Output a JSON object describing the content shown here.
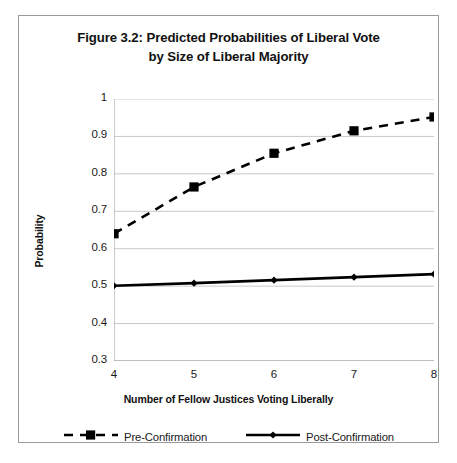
{
  "figure": {
    "title_line_1": "Figure 3.2: Predicted Probabilities of Liberal Vote",
    "title_line_2": "by Size of Liberal Majority"
  },
  "chart_data": {
    "type": "line",
    "title": "Figure 3.2: Predicted Probabilities of Liberal Vote by Size of Liberal Majority",
    "xlabel": "Number of Fellow Justices Voting Liberally",
    "ylabel": "Probability",
    "x": [
      4,
      5,
      6,
      7,
      8
    ],
    "xlim": [
      4,
      8
    ],
    "ylim": [
      0.3,
      1
    ],
    "xticks": [
      "4",
      "5",
      "6",
      "7",
      "8"
    ],
    "yticks": [
      "0.3",
      "0.4",
      "0.5",
      "0.6",
      "0.7",
      "0.8",
      "0.9",
      "1"
    ],
    "grid": "horizontal",
    "legend_position": "bottom",
    "series": [
      {
        "name": "Pre-Confirmation",
        "values": [
          0.64,
          0.765,
          0.855,
          0.915,
          0.952
        ],
        "line_style": "dashed",
        "marker": "square",
        "color": "#000000"
      },
      {
        "name": "Post-Confirmation",
        "values": [
          0.501,
          0.508,
          0.516,
          0.524,
          0.532
        ],
        "line_style": "solid",
        "marker": "diamond",
        "color": "#000000"
      }
    ]
  },
  "colors": {
    "series_line": "#000000",
    "gridline": "#c9c9c9",
    "axis": "#9a9a9a",
    "frame_border": "#9a9a9a",
    "text": "#1a1a1a"
  }
}
